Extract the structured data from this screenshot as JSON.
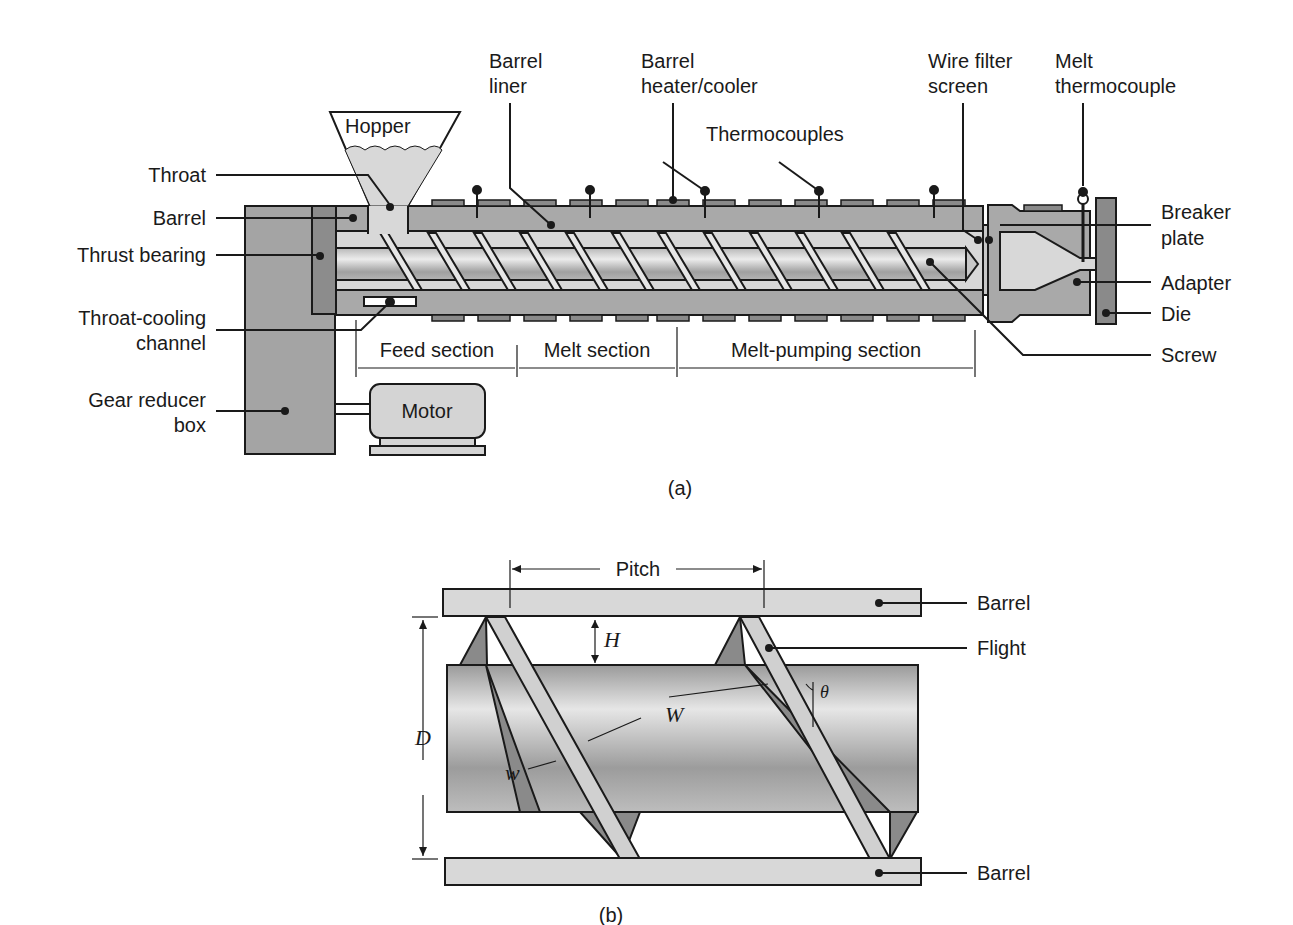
{
  "figure_a": {
    "caption": "(a)",
    "labels": {
      "barrel_liner": [
        "Barrel",
        "liner"
      ],
      "barrel_heater": [
        "Barrel",
        "heater/cooler"
      ],
      "wire_filter": [
        "Wire filter",
        "screen"
      ],
      "melt_thermocouple": [
        "Melt",
        "thermocouple"
      ],
      "thermocouples": "Thermocouples",
      "hopper": "Hopper",
      "throat": "Throat",
      "barrel": "Barrel",
      "thrust_bearing": "Thrust bearing",
      "throat_cooling": [
        "Throat-cooling",
        "channel"
      ],
      "gear_reducer": [
        "Gear reducer",
        "box"
      ],
      "motor": "Motor",
      "breaker_plate": [
        "Breaker",
        "plate"
      ],
      "adapter": "Adapter",
      "die": "Die",
      "screw": "Screw",
      "feed_section": "Feed section",
      "melt_section": "Melt section",
      "melt_pumping_section": "Melt-pumping section"
    }
  },
  "figure_b": {
    "caption": "(b)",
    "labels": {
      "pitch": "Pitch",
      "barrel_top": "Barrel",
      "barrel_bottom": "Barrel",
      "flight": "Flight",
      "H": "H",
      "D": "D",
      "W": "W",
      "w": "w",
      "theta": "θ"
    }
  },
  "colors": {
    "dark_gray": "#8a8a8a",
    "mid_gray": "#a9a9a9",
    "light_gray": "#d6d6d6",
    "outline": "#1a1a1a"
  }
}
